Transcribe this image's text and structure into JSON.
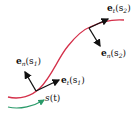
{
  "diagram": {
    "curve_color": "#d4304a",
    "vector_color": "#111111",
    "param_arrow_color": "#2a9a6a",
    "labels": {
      "et_s2": {
        "vec": "e",
        "sub": "t",
        "arg": "(s",
        "argsub": "2",
        "close": ")"
      },
      "en_s2": {
        "vec": "e",
        "sub": "n",
        "arg": "(s",
        "argsub": "2",
        "close": ")"
      },
      "en_s1": {
        "vec": "e",
        "sub": "n",
        "arg": "(s",
        "argsub": "1",
        "close": ")"
      },
      "et_s1": {
        "vec": "e",
        "sub": "t",
        "arg": "(s",
        "argsub": "1",
        "close": ")"
      },
      "s_of_t": {
        "name": "s",
        "arg": "(t)"
      }
    }
  }
}
